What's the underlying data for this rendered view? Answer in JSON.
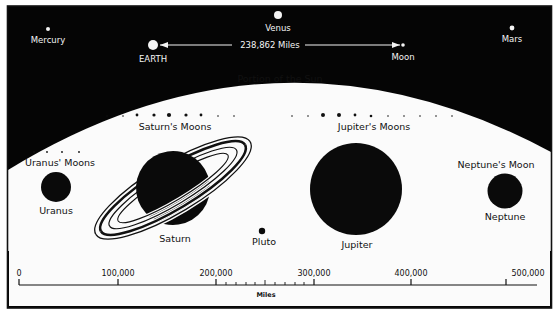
{
  "diagram": {
    "title": "Portion of the Sun",
    "colors": {
      "space": "#050505",
      "sun": "#fbfbfb",
      "planet": "#0a0a0a",
      "background": "#ffffff",
      "frame": "#111111"
    },
    "inner_planets": {
      "mercury": {
        "label": "Mercury"
      },
      "venus": {
        "label": "Venus"
      },
      "earth": {
        "label": "EARTH"
      },
      "moon": {
        "label": "Moon"
      },
      "mars": {
        "label": "Mars"
      }
    },
    "earth_moon_distance": {
      "label": "238,862 Miles"
    },
    "outer_planets": {
      "uranus": {
        "label": "Uranus",
        "moons_label": "Uranus' Moons"
      },
      "saturn": {
        "label": "Saturn",
        "moons_label": "Saturn's Moons"
      },
      "pluto": {
        "label": "Pluto"
      },
      "jupiter": {
        "label": "Jupiter",
        "moons_label": "Jupiter's Moons"
      },
      "neptune": {
        "label": "Neptune",
        "moons_label": "Neptune's Moon"
      }
    },
    "scale_bar": {
      "unit_label": "Miles",
      "ticks": [
        "0",
        "100,000",
        "200,000",
        "300,000",
        "400,000",
        "500,000"
      ],
      "tick_values": [
        0,
        100000,
        200000,
        300000,
        400000,
        500000
      ],
      "minor_ticks_between": [
        "200,000",
        "300,000"
      ]
    }
  }
}
